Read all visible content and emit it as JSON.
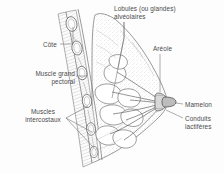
{
  "figure": {
    "language": "fr",
    "line_color": "#5a5a5a",
    "text_color": "#4a4a4a",
    "background_color": "#fdfdfd",
    "labels": {
      "lobules": "Lobules (ou glandes)\nalvéolaires",
      "lobules_line1": "Lobules (ou glandes)",
      "lobules_line2": "alvéolaires",
      "cote": "Côte",
      "areole": "Aréole",
      "pectoral_line1": "Muscle grand",
      "pectoral_line2": "pectoral",
      "mamelon": "Mamelon",
      "conduits_line1": "Conduits",
      "conduits_line2": "lactifères",
      "intercostaux_line1": "Muscles",
      "intercostaux_line2": "intercostaux"
    },
    "parts": [
      "Lobules (ou glandes) alvéolaires",
      "Côte",
      "Aréole",
      "Muscle grand pectoral",
      "Mamelon",
      "Conduits lactifères",
      "Muscles intercostaux"
    ]
  }
}
